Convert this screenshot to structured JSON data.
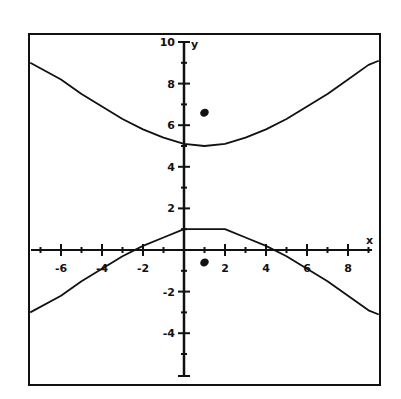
{
  "chart_data": {
    "type": "line",
    "title": "",
    "xlabel": "x",
    "ylabel": "y",
    "xlim": [
      -7.5,
      9.5
    ],
    "ylim": [
      -6.4,
      10.4
    ],
    "grid": false,
    "legend": null,
    "x_ticks": [
      -6,
      -4,
      -2,
      2,
      4,
      6,
      8
    ],
    "x_minor_ticks": [
      -7,
      -5,
      -3,
      -1,
      1,
      3,
      5,
      7,
      9
    ],
    "y_ticks": [
      10,
      8,
      6,
      4,
      2,
      -2,
      -4
    ],
    "y_tick_labels": [
      "10",
      "8",
      "6",
      "4",
      "2",
      "-2",
      "-4"
    ],
    "y_minor_ticks": [
      9,
      7,
      5,
      3,
      1,
      -1,
      -3,
      -5
    ],
    "series": [
      {
        "name": "upper branch",
        "x": [
          -7.5,
          -6,
          -5,
          -4,
          -3,
          -2,
          -1,
          0,
          1,
          2,
          3,
          4,
          5,
          6,
          7,
          8,
          9,
          9.5
        ],
        "values": [
          9.0,
          8.2,
          7.5,
          6.9,
          6.3,
          5.8,
          5.4,
          5.1,
          5.0,
          5.1,
          5.4,
          5.8,
          6.3,
          6.9,
          7.5,
          8.2,
          8.9,
          9.1
        ]
      },
      {
        "name": "lower branch",
        "x": [
          -7.5,
          -6,
          -5,
          -4,
          -3,
          -2,
          -1,
          0,
          2,
          3,
          4,
          5,
          6,
          7,
          8,
          9,
          9.5
        ],
        "values": [
          -3.0,
          -2.2,
          -1.5,
          -0.9,
          -0.3,
          0.2,
          0.6,
          1.0,
          1.0,
          0.6,
          0.2,
          -0.3,
          -0.9,
          -1.5,
          -2.2,
          -2.9,
          -3.1
        ]
      }
    ],
    "points": [
      {
        "name": "upper focus",
        "x": 1,
        "y": 6.6
      },
      {
        "name": "lower focus",
        "x": 1,
        "y": -0.6
      }
    ]
  }
}
